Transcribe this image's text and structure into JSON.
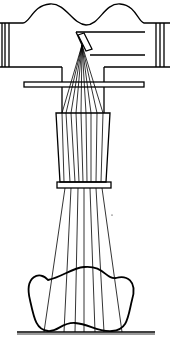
{
  "diagram": {
    "title": "",
    "stroke_color": "#000000",
    "background": "#ffffff",
    "labels": []
  }
}
